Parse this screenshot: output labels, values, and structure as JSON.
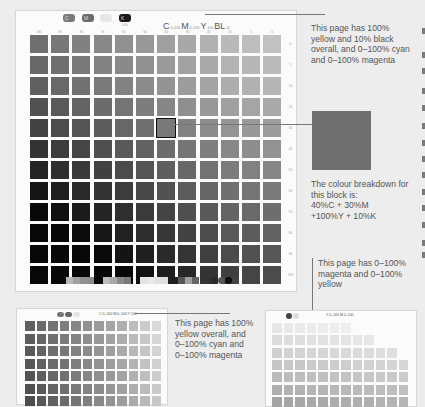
{
  "main_page": {
    "header": {
      "channel_tabs": [
        {
          "name": "cyan",
          "label": "C",
          "color": "#7a7a7a"
        },
        {
          "name": "magenta",
          "label": "M",
          "color": "#6a6a6a"
        },
        {
          "name": "yellow",
          "label": "",
          "color": "#e6e6e6"
        },
        {
          "name": "black",
          "label": "K",
          "color": "#1a1a1a",
          "sublabel": "10%"
        }
      ],
      "formula": [
        {
          "big": "C",
          "small": "0–100"
        },
        {
          "big": "M",
          "small": "0–100"
        },
        {
          "big": "Y",
          "small": "100"
        },
        {
          "big": "BL",
          "small": "10"
        }
      ]
    },
    "grid": {
      "column_labels": [
        "100",
        "90",
        "80",
        "70",
        "60",
        "50",
        "40",
        "30",
        "20",
        "10",
        "5",
        "0"
      ],
      "row_labels": [
        "0",
        "5",
        "10",
        "20",
        "30",
        "40",
        "50",
        "60",
        "70",
        "80",
        "90",
        "100"
      ],
      "highlighted_cell": {
        "column_label": "40",
        "row_label": "30"
      }
    },
    "footer_swatch_groups": 4
  },
  "annotations": {
    "page_description": "This page has 100% yellow and 10% black overall, and 0–100% cyan and 0–100% magenta",
    "breakdown_intro": "The colour breakdown for this block is:",
    "breakdown_line1": "40%C + 30%M",
    "breakdown_line2": "+100%Y + 10%K",
    "swatch_color": "#707070"
  },
  "thumb_left": {
    "formula": "C 0–100 M 0–100 Y 100",
    "caption": "This page has 100% yellow overall, and 0–100% cyan and 0–100% magenta"
  },
  "thumb_right": {
    "formula": "Y 0–100 M 0–100",
    "caption": "This page has 0–100% magenta and 0–100% yellow"
  }
}
